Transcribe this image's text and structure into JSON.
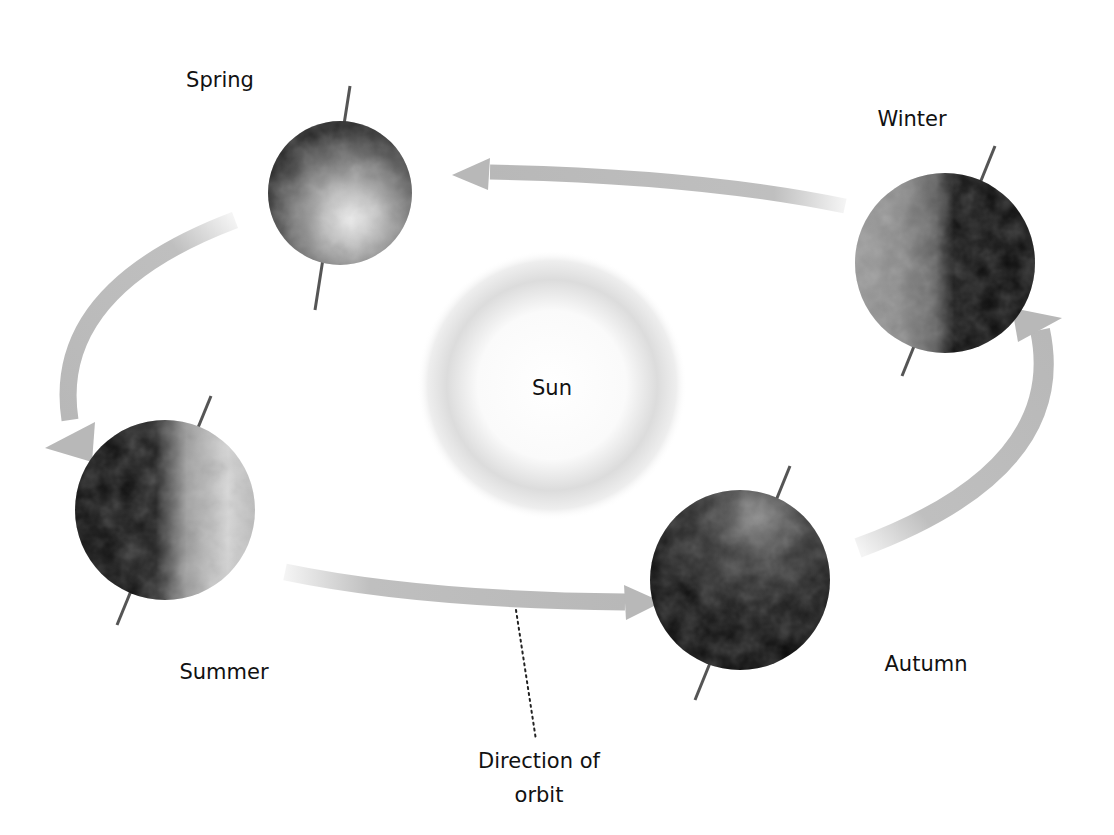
{
  "diagram": {
    "sun": {
      "label": "Sun"
    },
    "seasons": [
      {
        "id": "spring",
        "label": "Spring"
      },
      {
        "id": "winter",
        "label": "Winter"
      },
      {
        "id": "summer",
        "label": "Summer"
      },
      {
        "id": "autumn",
        "label": "Autumn"
      }
    ],
    "callout": {
      "line1": "Direction of",
      "line2": "orbit"
    },
    "colors": {
      "arrow": "#b8b8b8",
      "axis": "#555555",
      "earth_light": "#e8e8e8",
      "earth_dark": "#0a0a0a",
      "sun_glow": "#d8d8d8",
      "text": "#111111"
    }
  }
}
